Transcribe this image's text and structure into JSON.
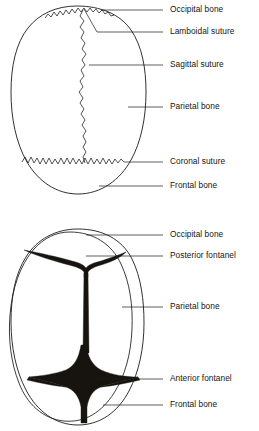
{
  "document": {
    "title": "Infant Skull — Sutures and Fontanels",
    "background_color": "#ffffff",
    "ink_color": "#1a1a1a",
    "fontanel_fill": "#17140f"
  },
  "figures": [
    {
      "id": "superior-view-sutures",
      "name": "Skull superior view showing sutures",
      "view": "Superior (top) view of infant skull showing suture lines",
      "labels": [
        {
          "id": "occipital-bone",
          "text": "Occipital bone",
          "text_x": 170,
          "text_y": 10,
          "leader": {
            "x1": 163,
            "y1": 10,
            "x2": 101,
            "y2": 10
          }
        },
        {
          "id": "lamboidal-suture",
          "text": "Lamboidal suture",
          "text_x": 170,
          "text_y": 32,
          "leader": {
            "points": "163,32 97,32 84,9"
          }
        },
        {
          "id": "sagittal-suture",
          "text": "Sagittal suture",
          "text_x": 170,
          "text_y": 65,
          "leader": {
            "x1": 163,
            "y1": 65,
            "x2": 89,
            "y2": 65
          }
        },
        {
          "id": "parietal-bone",
          "text": "Parietal bone",
          "text_x": 170,
          "text_y": 107,
          "leader": {
            "x1": 163,
            "y1": 107,
            "x2": 128,
            "y2": 107
          }
        },
        {
          "id": "coronal-suture",
          "text": "Coronal suture",
          "text_x": 170,
          "text_y": 162,
          "leader": {
            "x1": 163,
            "y1": 162,
            "x2": 124,
            "y2": 162
          }
        },
        {
          "id": "frontal-bone",
          "text": "Frontal bone",
          "text_x": 170,
          "text_y": 186,
          "leader": {
            "x1": 163,
            "y1": 186,
            "x2": 99,
            "y2": 186
          }
        }
      ]
    },
    {
      "id": "superior-view-fontanels",
      "name": "Skull superior view showing fontanels",
      "view": "Superior (top) view of infant skull showing fontanels",
      "labels": [
        {
          "id": "occipital-bone-2",
          "text": "Occipital bone",
          "text_x": 170,
          "text_y": 20,
          "leader": {
            "x1": 163,
            "y1": 20,
            "x2": 86,
            "y2": 20
          }
        },
        {
          "id": "posterior-fontanel",
          "text": "Posterior fontanel",
          "text_x": 170,
          "text_y": 41,
          "leader": {
            "x1": 163,
            "y1": 41,
            "x2": 86,
            "y2": 41
          }
        },
        {
          "id": "parietal-bone-2",
          "text": "Parietal bone",
          "text_x": 170,
          "text_y": 92,
          "leader": {
            "x1": 163,
            "y1": 92,
            "x2": 122,
            "y2": 92
          }
        },
        {
          "id": "anterior-fontanel",
          "text": "Anterior fontanel",
          "text_x": 170,
          "text_y": 164,
          "leader": {
            "x1": 163,
            "y1": 164,
            "x2": 92,
            "y2": 164
          }
        },
        {
          "id": "frontal-bone-2",
          "text": "Frontal bone",
          "text_x": 170,
          "text_y": 190,
          "leader": {
            "x1": 163,
            "y1": 190,
            "x2": 103,
            "y2": 190
          }
        }
      ]
    }
  ],
  "anatomy": {
    "structures": [
      "Occipital bone",
      "Lamboidal suture",
      "Sagittal suture",
      "Parietal bone",
      "Coronal suture",
      "Frontal bone",
      "Posterior fontanel",
      "Anterior fontanel"
    ]
  }
}
